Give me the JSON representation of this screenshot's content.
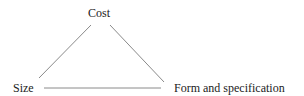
{
  "diagram": {
    "type": "triangle",
    "nodes": {
      "top": "Cost",
      "left": "Size",
      "right": "Form and specification"
    },
    "edges": [
      {
        "from": "Cost",
        "to": "Size"
      },
      {
        "from": "Cost",
        "to": "Form and specification"
      },
      {
        "from": "Size",
        "to": "Form and specification"
      }
    ],
    "line_color": "#8a8a8a"
  }
}
